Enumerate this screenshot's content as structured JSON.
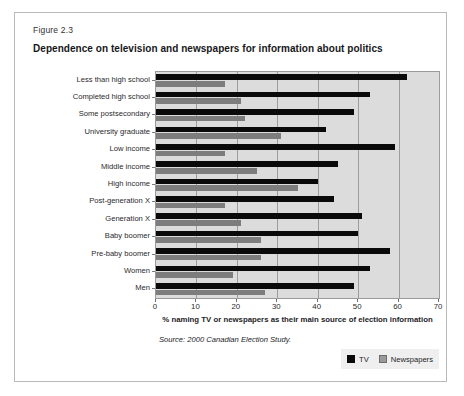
{
  "figure": {
    "number_label": "Figure 2.3",
    "title": "Dependence on television and newspapers for information about politics",
    "source_note": "Source: 2000 Canadian Election Study."
  },
  "legend": {
    "position": "bottom-right",
    "items": [
      {
        "label": "TV",
        "color": "#0a0a0a",
        "icon": "square-swatch"
      },
      {
        "label": "Newspapers",
        "color": "#9a9a9a",
        "icon": "square-swatch"
      }
    ]
  },
  "colors": {
    "tv_bar": "#0a0a0a",
    "newspapers_bar": "#7d7d7d",
    "plot_background": "#dcdcdc",
    "gridline": "#9d9d9d",
    "frame_border": "#b9b9b9"
  },
  "chart_data": {
    "type": "bar",
    "orientation": "horizontal",
    "title": "Dependence on television and newspapers for information about politics",
    "subtitle": "Figure 2.3",
    "xlabel": "% naming TV or newspapers as their main source of election information",
    "ylabel": "",
    "xlim": [
      0,
      70
    ],
    "xticks": [
      0,
      10,
      20,
      30,
      40,
      50,
      60,
      70
    ],
    "xtick_labels": [
      "0",
      "10",
      "20",
      "30",
      "40",
      "50",
      "60",
      "70"
    ],
    "grid": true,
    "grid_axis": "x",
    "legend_position": "bottom-right",
    "categories": [
      "Less than high school",
      "Completed high school",
      "Some postsecondary",
      "University graduate",
      "Low income",
      "Middle income",
      "High income",
      "Post-generation X",
      "Generation X",
      "Baby boomer",
      "Pre-baby boomer",
      "Women",
      "Men"
    ],
    "series": [
      {
        "name": "TV",
        "color": "#0a0a0a",
        "values": [
          62,
          53,
          49,
          42,
          59,
          45,
          40,
          44,
          51,
          50,
          58,
          53,
          49
        ]
      },
      {
        "name": "Newspapers",
        "color": "#7d7d7d",
        "values": [
          17,
          21,
          22,
          31,
          17,
          25,
          35,
          17,
          21,
          26,
          26,
          19,
          27
        ]
      }
    ],
    "source": "Source: 2000 Canadian Election Study."
  }
}
